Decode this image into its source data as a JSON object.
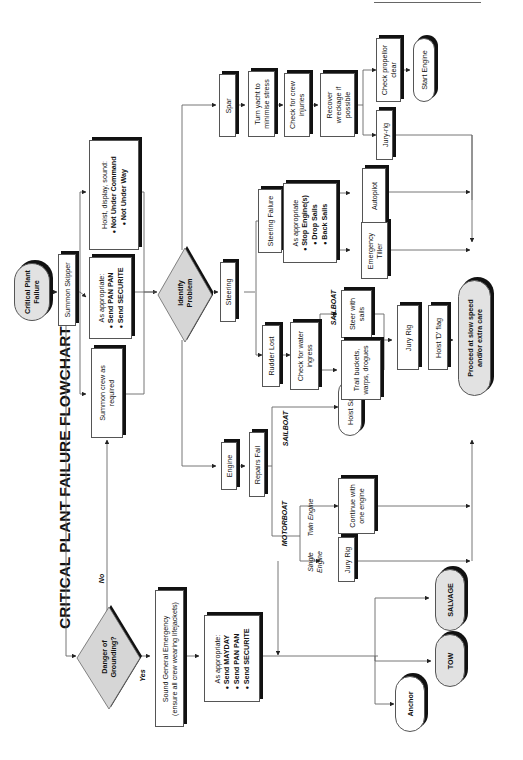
{
  "title": "CRITICAL PLANT FAILURE FLOWCHART",
  "orientation": "rotated 90 degrees counter-clockwise",
  "nodes": {
    "start": "Critical Plant Failure",
    "summon_skipper": "Summon Skipper",
    "hoist_display": {
      "intro": "Hoist, display, sound:",
      "items": [
        "Not Under Command",
        "Not Under Way"
      ]
    },
    "send_panpan": {
      "intro": "As appropriate:",
      "items": [
        "Send PAN PAN",
        "Send SECURITE"
      ]
    },
    "summon_crew": "Summon crew as required",
    "identify_problem": "Identify Problem",
    "danger_grounding": "Danger of Grounding?",
    "sound_general": {
      "line1": "Sound General Emergency",
      "line2": "(ensure all crew wearing lifejackets)"
    },
    "send_mayday": {
      "intro": "As appropriate:",
      "items": [
        "Send MAYDAY",
        "Send PAN PAN",
        "Send SECURITE"
      ]
    },
    "anchor": "Anchor",
    "tow": "TOW",
    "salvage": "SALVAGE",
    "engine": "Engine",
    "repairs_fail": "Repairs Fail",
    "hoist_sails": "Hoist Sails",
    "continue_one_engine": "Continue with one engine",
    "jury_rig_engine": "Jury Rig",
    "steering": "Steering",
    "rudder_lost": "Rudder Lost",
    "check_water": "Check for water ingress",
    "steer_with_sails": "Steer with sails",
    "trail_buckets": "Trail buckets, warps, drogues",
    "jury_rig_rudder": "Jury Rig",
    "hoist_d_flag": "Hoist 'D' flag",
    "steering_failure": "Steering Failure",
    "stop_engines": {
      "intro": "As appropriate",
      "items": [
        "Stop Engine(s)",
        "Drop Sails",
        "Back Sails"
      ]
    },
    "emergency_tiller": "Emergency Tiller",
    "autopilot": "Autopilot",
    "spar": "Spar",
    "turn_yacht": "Turn yacht to minimise stress",
    "check_crew": "Check for crew injuries",
    "recover_wreckage": "Recover wreckage if possible",
    "check_propellor": "Check propellor clear",
    "start_engine": "Start Engine",
    "jury_rig_spar": "Jury-rig",
    "proceed": "Proceed at slow speed and/or extra care"
  },
  "edge_labels": {
    "no": "No",
    "yes": "Yes",
    "sailboat_engine": "SAILBOAT",
    "motorboat": "MOTORBOAT",
    "twin_engine": "Twin Engine",
    "single_engine": "Single Engine",
    "sailboat_rudder": "SAILBOAT"
  },
  "colors": {
    "box_fill": "#ffffff",
    "terminal_grey": "#e2e2e2",
    "shadow": "#111111",
    "line": "#555555"
  }
}
